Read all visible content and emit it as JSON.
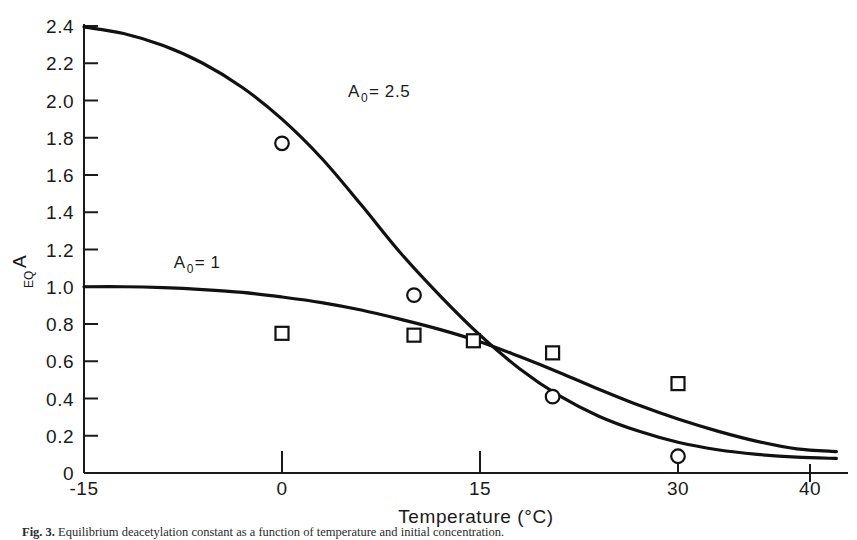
{
  "figure": {
    "caption_label": "Fig. 3.",
    "caption_text": "Equilibrium deacetylation constant as a function of temperature and initial concentration."
  },
  "chart_data": {
    "type": "line",
    "title": "",
    "subtitle": "",
    "xlabel": "Temperature (°C)",
    "ylabel": "A_EQ",
    "ylabel_main": "A",
    "ylabel_sub": "EQ",
    "xlim": [
      -15,
      42
    ],
    "ylim": [
      0,
      2.4
    ],
    "grid": false,
    "legend": "inline-annotations",
    "xticks": [
      -15,
      0,
      15,
      30,
      40
    ],
    "xtick_labels": [
      "-15",
      "0",
      "15",
      "30",
      "40"
    ],
    "yticks": [
      0,
      0.2,
      0.4,
      0.6,
      0.8,
      1.0,
      1.2,
      1.4,
      1.6,
      1.8,
      2.0,
      2.2,
      2.4
    ],
    "ytick_labels": [
      "0",
      "0.2",
      "0.4",
      "0.6",
      "0.8",
      "1.0",
      "1.2",
      "1.4",
      "1.6",
      "1.8",
      "2.0",
      "2.2",
      "2.4"
    ],
    "annotations": [
      {
        "name": "curve-label-a0-2-5",
        "text": "A",
        "sub": "0",
        "tail": " = 2.5",
        "x": 5.0,
        "y": 2.02
      },
      {
        "name": "curve-label-a0-1",
        "text": "A",
        "sub": "0",
        "tail": " = 1",
        "x": -8.2,
        "y": 1.1
      }
    ],
    "series": [
      {
        "name": "A0 = 2.5",
        "marker": "circle",
        "curve": [
          [
            -15,
            2.395
          ],
          [
            -12,
            2.36
          ],
          [
            -9,
            2.295
          ],
          [
            -6,
            2.2
          ],
          [
            -3,
            2.07
          ],
          [
            0,
            1.9
          ],
          [
            3,
            1.69
          ],
          [
            6,
            1.44
          ],
          [
            9,
            1.18
          ],
          [
            12,
            0.95
          ],
          [
            15,
            0.74
          ],
          [
            18,
            0.56
          ],
          [
            21,
            0.415
          ],
          [
            24,
            0.305
          ],
          [
            27,
            0.225
          ],
          [
            30,
            0.165
          ],
          [
            33,
            0.125
          ],
          [
            36,
            0.1
          ],
          [
            39,
            0.085
          ],
          [
            42,
            0.078
          ]
        ],
        "points": [
          [
            0,
            1.77
          ],
          [
            10,
            0.955
          ],
          [
            20.5,
            0.41
          ],
          [
            30,
            0.09
          ]
        ]
      },
      {
        "name": "A0 = 1",
        "marker": "square",
        "curve": [
          [
            -15,
            1.0
          ],
          [
            -12,
            1.0
          ],
          [
            -9,
            0.995
          ],
          [
            -6,
            0.985
          ],
          [
            -3,
            0.97
          ],
          [
            0,
            0.945
          ],
          [
            3,
            0.915
          ],
          [
            6,
            0.875
          ],
          [
            9,
            0.825
          ],
          [
            12,
            0.77
          ],
          [
            15,
            0.705
          ],
          [
            18,
            0.625
          ],
          [
            21,
            0.54
          ],
          [
            24,
            0.45
          ],
          [
            27,
            0.365
          ],
          [
            30,
            0.29
          ],
          [
            33,
            0.225
          ],
          [
            36,
            0.17
          ],
          [
            39,
            0.13
          ],
          [
            42,
            0.115
          ]
        ],
        "points": [
          [
            0,
            0.75
          ],
          [
            10,
            0.74
          ],
          [
            14.5,
            0.71
          ],
          [
            20.5,
            0.645
          ],
          [
            30,
            0.48
          ]
        ]
      }
    ]
  }
}
